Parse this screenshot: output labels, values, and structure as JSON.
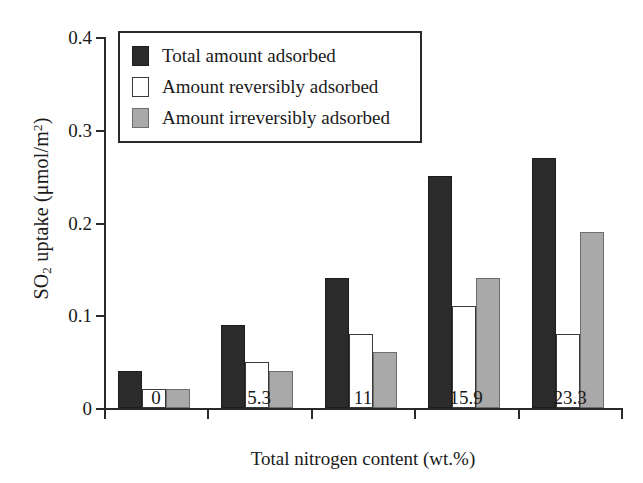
{
  "chart_data": {
    "type": "bar",
    "title": "",
    "xlabel": "Total nitrogen content (wt.%)",
    "ylabel": "SO2 uptake (μmol/m2)",
    "ylabel_parts": {
      "prefix": "SO",
      "sub": "2",
      "middle": " uptake (μmol/m",
      "sup": "2",
      "suffix": ")"
    },
    "categories": [
      "0",
      "5.3",
      "11",
      "15.9",
      "23.3"
    ],
    "ylim": [
      0,
      0.4
    ],
    "yticks": [
      "0",
      "0.1",
      "0.2",
      "0.3",
      "0.4"
    ],
    "ytick_values": [
      0,
      0.1,
      0.2,
      0.3,
      0.4
    ],
    "grid": false,
    "legend_position": "upper-left-inside",
    "series": [
      {
        "name": "Total amount adsorbed",
        "color": "#2b2b2b",
        "values": [
          0.04,
          0.09,
          0.14,
          0.25,
          0.27
        ]
      },
      {
        "name": "Amount reversibly adsorbed",
        "color": "#ffffff",
        "values": [
          0.02,
          0.05,
          0.08,
          0.11,
          0.08
        ]
      },
      {
        "name": "Amount irreversibly adsorbed",
        "color": "#a9a9a9",
        "values": [
          0.02,
          0.04,
          0.06,
          0.14,
          0.19
        ]
      }
    ]
  }
}
